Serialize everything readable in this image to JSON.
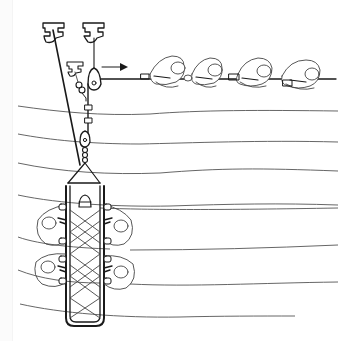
{
  "figure": {
    "title": "Rope rescue haul system with stretcher",
    "caption": "",
    "background": "#ffffff",
    "ink_color": "#1a1a1a",
    "wave_color": "#555555"
  },
  "elements": {
    "anchors": [
      {
        "name": "anchor-left",
        "type": "T-anchor"
      },
      {
        "name": "anchor-right",
        "type": "T-anchor"
      },
      {
        "name": "anchor-small",
        "type": "T-anchor"
      }
    ],
    "pulley": {
      "name": "haul-pulley"
    },
    "haul_direction": {
      "symbol": "→",
      "direction": "right"
    },
    "haulers": {
      "count": 4,
      "posture": "crouched pulling rope"
    },
    "rope_grabs": {
      "count": 2
    },
    "stretcher": {
      "type": "basket litter",
      "lacing": "criss-cross",
      "attendants": 4,
      "patient": 1
    },
    "slope_lines": {
      "count": 8
    }
  }
}
